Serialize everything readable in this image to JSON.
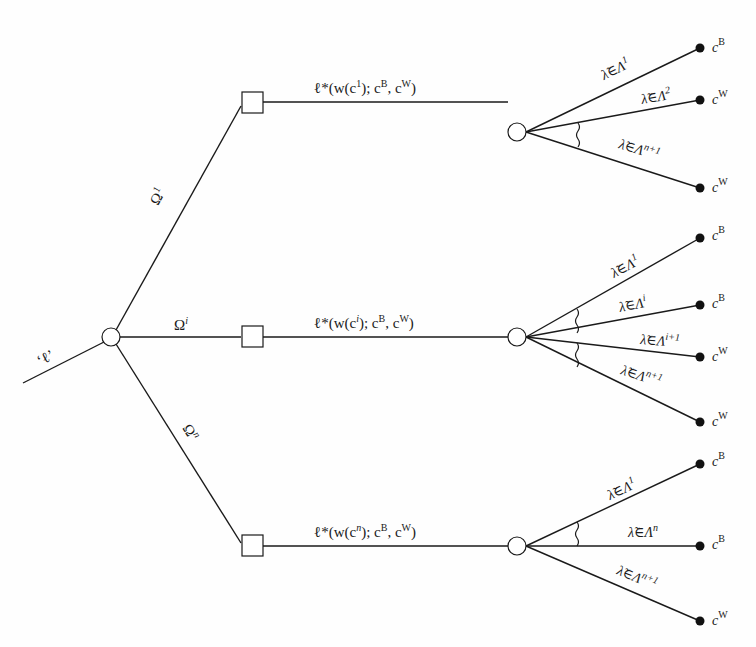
{
  "diagram": {
    "type": "decision-tree",
    "root": {
      "entry_label": "‘ℓ’",
      "node": "chance"
    },
    "branches": [
      {
        "id": "1",
        "edge_label": "Ω",
        "edge_label_sup": "1",
        "decision_label": {
          "pre": "ℓ*(w(c",
          "sup": "1",
          "post": "); c",
          "sup_b": "B",
          "mid": ", c",
          "sup_w": "W",
          "end": ")"
        },
        "outcomes": [
          {
            "event": "λ̃∈Λ",
            "sup": "1",
            "leaf": "c",
            "leaf_sup": "B"
          },
          {
            "event": "λ̃∈Λ",
            "sup": "2",
            "leaf": "c",
            "leaf_sup": "W"
          },
          {
            "event": "λ̃∈Λ",
            "sup": "n+1",
            "leaf": "c",
            "leaf_sup": "W"
          }
        ]
      },
      {
        "id": "i",
        "edge_label": "Ω",
        "edge_label_sup": "i",
        "decision_label": {
          "pre": "ℓ*(w(c",
          "sup": "i",
          "post": "); c",
          "sup_b": "B",
          "mid": ", c",
          "sup_w": "W",
          "end": ")"
        },
        "outcomes": [
          {
            "event": "λ̃∈Λ",
            "sup": "1",
            "leaf": "c",
            "leaf_sup": "B"
          },
          {
            "event": "λ̃∈Λ",
            "sup": "i",
            "leaf": "c",
            "leaf_sup": "B"
          },
          {
            "event": "λ̃∈Λ",
            "sup": "i+1",
            "leaf": "c",
            "leaf_sup": "W"
          },
          {
            "event": "λ̃∈Λ",
            "sup": "n+1",
            "leaf": "c",
            "leaf_sup": "W"
          }
        ]
      },
      {
        "id": "n",
        "edge_label": "Ω",
        "edge_label_sup": "n",
        "decision_label": {
          "pre": "ℓ*(w(c",
          "sup": "n",
          "post": "); c",
          "sup_b": "B",
          "mid": ", c",
          "sup_w": "W",
          "end": ")"
        },
        "outcomes": [
          {
            "event": "λ̃∈Λ",
            "sup": "1",
            "leaf": "c",
            "leaf_sup": "B"
          },
          {
            "event": "λ̃∈Λ",
            "sup": "n",
            "leaf": "c",
            "leaf_sup": "B"
          },
          {
            "event": "λ̃∈Λ",
            "sup": "n+1",
            "leaf": "c",
            "leaf_sup": "W"
          }
        ]
      }
    ]
  }
}
